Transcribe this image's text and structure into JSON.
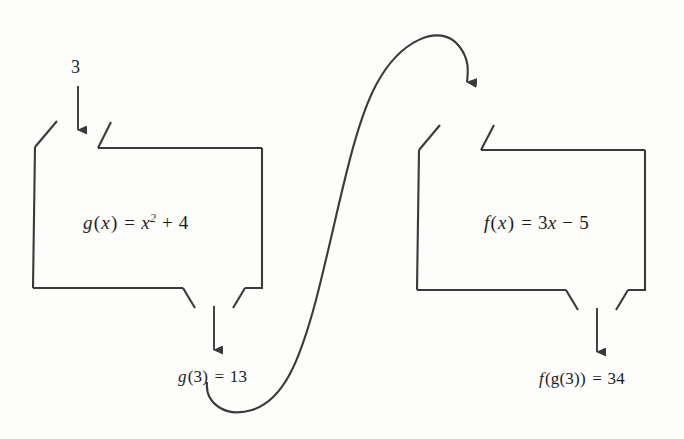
{
  "diagram": {
    "type": "function-machine-flow",
    "background_color": "#fdfdfc",
    "stroke_color": "#3a3a3a",
    "text_color": "#1c1c1c"
  },
  "input": {
    "value": "3",
    "arrow_name": "input-arrow-to-g"
  },
  "machine_g": {
    "formula_plain": "g(x) = x² + 4",
    "function_name": "g",
    "variable": "x",
    "equals": "=",
    "base": "x",
    "exponent": "2",
    "operator": "+",
    "constant": "4"
  },
  "machine_f": {
    "formula_plain": "f(x) = 3x − 5",
    "function_name": "f",
    "variable": "x",
    "equals": "=",
    "coefficient": "3",
    "term_variable": "x",
    "operator": "−",
    "constant": "5"
  },
  "output_g": {
    "label_plain": "g(3) = 13",
    "function_name": "g",
    "argument": "(3)",
    "equals": "=",
    "value": "13"
  },
  "output_f": {
    "label_plain": "f(g(3)) = 34",
    "function_name": "f",
    "argument": "(g(3))",
    "inner_function": "g",
    "equals": "=",
    "value": "34"
  },
  "connector": {
    "name": "s-curve-g-to-f",
    "description": "curved arrow from g(3) = 13 up and over into the f machine inlet"
  }
}
